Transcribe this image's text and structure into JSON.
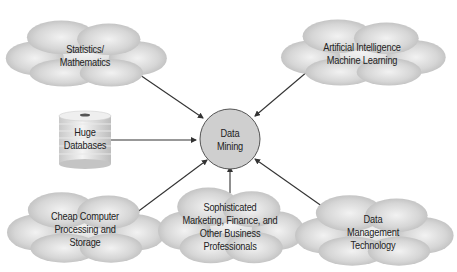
{
  "diagram": {
    "center": {
      "line1": "Data",
      "line2": "Mining"
    },
    "nodes": [
      {
        "id": "statistics",
        "lines": [
          "Statistics/",
          "Mathematics"
        ]
      },
      {
        "id": "ai",
        "lines": [
          "Artificial Intelligence",
          "Machine Learning"
        ]
      },
      {
        "id": "databases",
        "lines": [
          "Huge",
          "Databases"
        ]
      },
      {
        "id": "computer",
        "lines": [
          "Cheap Computer",
          "Processing and",
          "Storage"
        ]
      },
      {
        "id": "professionals",
        "lines": [
          "Sophisticated",
          "Marketing, Finance, and",
          "Other Business",
          "Professionals"
        ]
      },
      {
        "id": "datamgmt",
        "lines": [
          "Data",
          "Management",
          "Technology"
        ]
      }
    ],
    "colors": {
      "cloud_fill": "#c8c8c8",
      "circle_fill": "#cfcfcf",
      "arrow": "#333333"
    }
  }
}
